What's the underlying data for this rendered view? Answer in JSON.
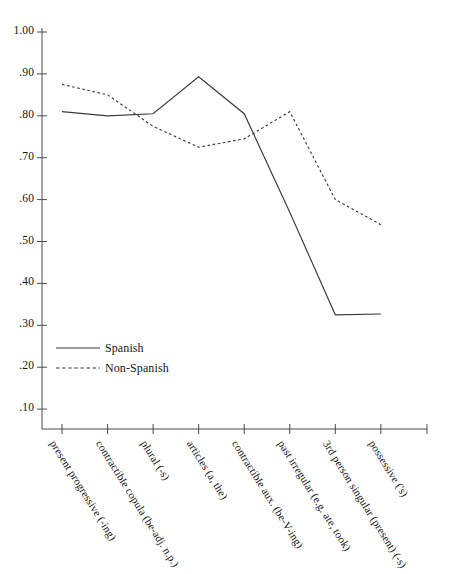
{
  "chart_data": {
    "type": "line",
    "title": "",
    "xlabel": "",
    "ylabel": "",
    "ylim": [
      0.0,
      1.0
    ],
    "yticks": [
      "1.00",
      ".90",
      ".80",
      ".70",
      ".60",
      ".50",
      ".40",
      ".30",
      ".20",
      ".10"
    ],
    "ytick_values": [
      1.0,
      0.9,
      0.8,
      0.7,
      0.6,
      0.5,
      0.4,
      0.3,
      0.2,
      0.1
    ],
    "grid": false,
    "legend_position": "inner-left-lower",
    "categories": [
      "present progressive (-ing)",
      "contractible copula (be-adj. n.p.)",
      "plural (-s)",
      "articles (a, the)",
      "contractible aux. (be-V-ing)",
      "past irregular (e.g. ate, took)",
      "3rd person singular (present) (-s)",
      "possessive ('s)"
    ],
    "series": [
      {
        "name": "Spanish",
        "style": "solid",
        "color": "#3a3a3a",
        "values": [
          0.81,
          0.8,
          0.805,
          0.893,
          0.805,
          0.57,
          0.325,
          0.327
        ]
      },
      {
        "name": "Non-Spanish",
        "style": "dashed",
        "color": "#3a3a3a",
        "values": [
          0.875,
          0.85,
          0.775,
          0.725,
          0.745,
          0.81,
          0.6,
          0.54
        ]
      }
    ]
  },
  "legend": {
    "items": [
      {
        "label": "Spanish"
      },
      {
        "label": "Non-Spanish"
      }
    ]
  }
}
